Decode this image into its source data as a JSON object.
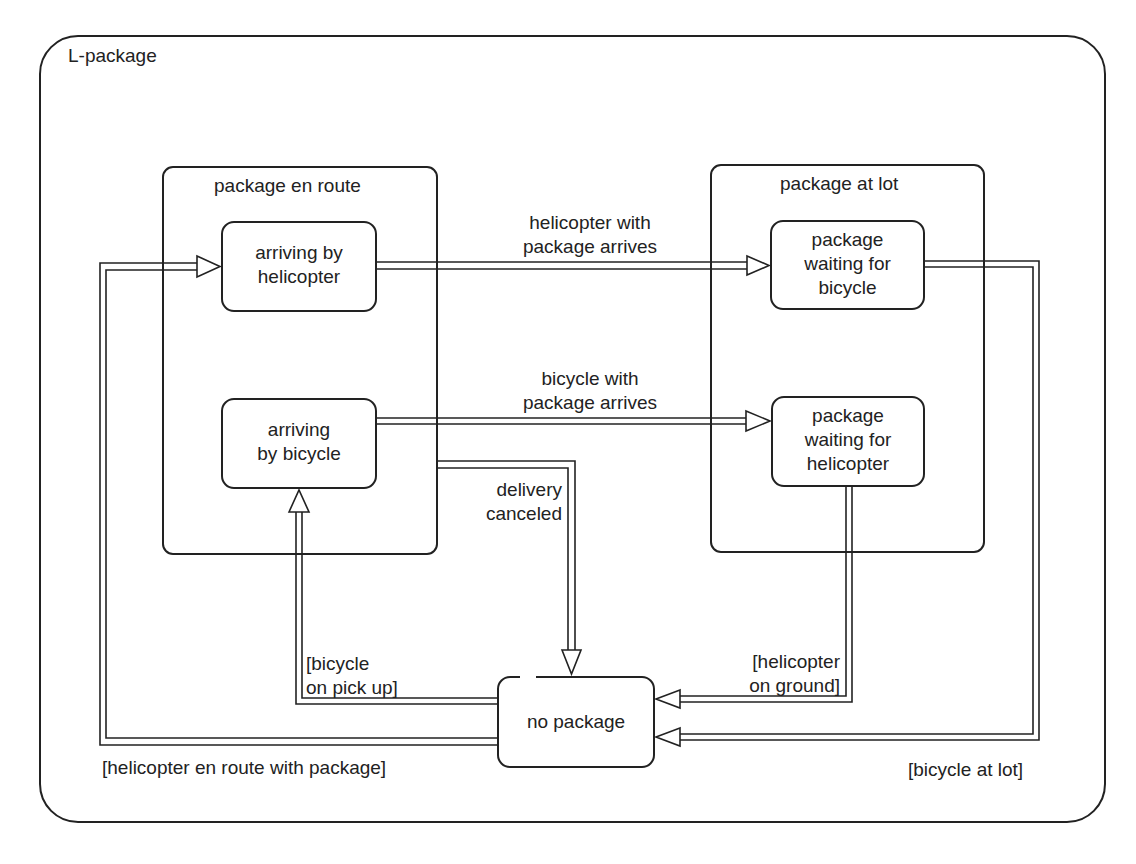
{
  "diagram": {
    "title": "L-package",
    "composites": [
      {
        "id": "en_route",
        "label": "package en route"
      },
      {
        "id": "at_lot",
        "label": "package at lot"
      }
    ],
    "states": {
      "arriving_helicopter": {
        "line1": "arriving by",
        "line2": "helicopter"
      },
      "arriving_bicycle": {
        "line1": "arriving",
        "line2": "by bicycle"
      },
      "waiting_bicycle": {
        "line1": "package",
        "line2": "waiting for",
        "line3": "bicycle"
      },
      "waiting_helicopter": {
        "line1": "package",
        "line2": "waiting for",
        "line3": "helicopter"
      },
      "no_package": {
        "line1": "no package"
      }
    },
    "transitions": {
      "helicopter_arrives": {
        "line1": "helicopter with",
        "line2": "package arrives"
      },
      "bicycle_arrives": {
        "line1": "bicycle with",
        "line2": "package arrives"
      },
      "delivery_canceled": {
        "line1": "delivery",
        "line2": "canceled"
      },
      "bicycle_on_pickup": {
        "line1": "[bicycle",
        "line2": "on pick up]"
      },
      "helicopter_on_ground": {
        "line1": "[helicopter",
        "line2": "on ground]"
      },
      "helicopter_en_route": {
        "line1": "[helicopter en route with package]"
      },
      "bicycle_at_lot": {
        "line1": "[bicycle at lot]"
      }
    },
    "colors": {
      "stroke": "#222222",
      "background": "#ffffff"
    }
  }
}
